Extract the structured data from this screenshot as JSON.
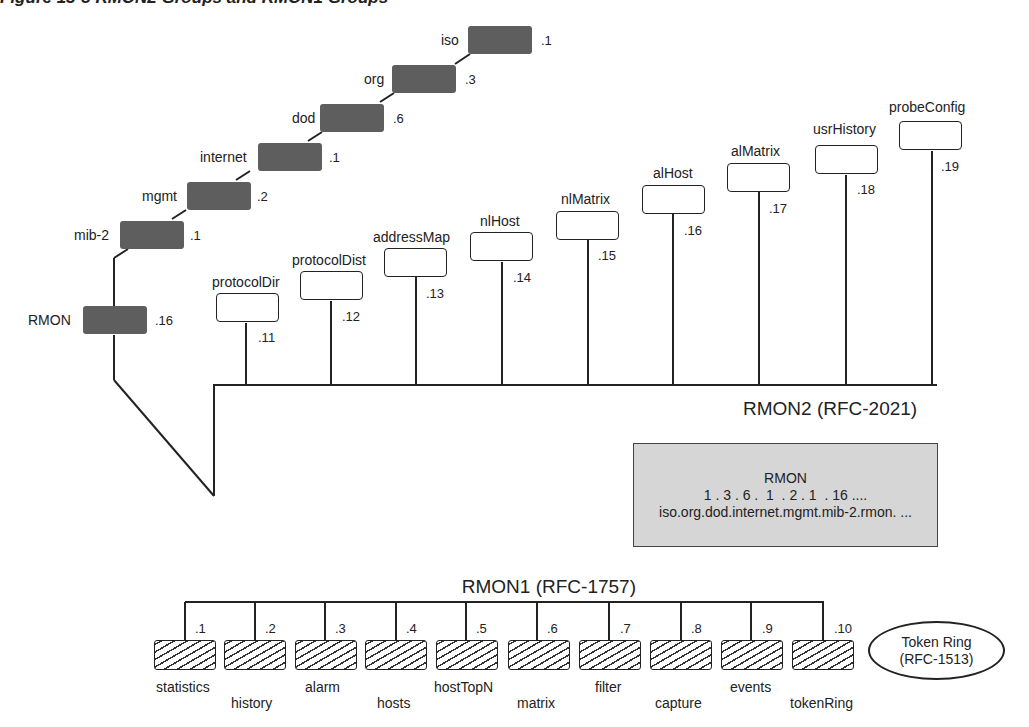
{
  "figure": {
    "title_clipped": "Figure 15-3    RMON2 Groups and RMON1 Groups"
  },
  "oid_path": [
    {
      "name": "iso",
      "oid": ".1"
    },
    {
      "name": "org",
      "oid": ".3"
    },
    {
      "name": "dod",
      "oid": ".6"
    },
    {
      "name": "internet",
      "oid": ".1"
    },
    {
      "name": "mgmt",
      "oid": ".2"
    },
    {
      "name": "mib-2",
      "oid": ".1"
    },
    {
      "name": "RMON",
      "oid": ".16"
    }
  ],
  "rmon2": {
    "label": "RMON2 (RFC-2021)",
    "groups": [
      {
        "name": "protocolDir",
        "oid": ".11"
      },
      {
        "name": "protocolDist",
        "oid": ".12"
      },
      {
        "name": "addressMap",
        "oid": ".13"
      },
      {
        "name": "nlHost",
        "oid": ".14"
      },
      {
        "name": "nlMatrix",
        "oid": ".15"
      },
      {
        "name": "alHost",
        "oid": ".16"
      },
      {
        "name": "alMatrix",
        "oid": ".17"
      },
      {
        "name": "usrHistory",
        "oid": ".18"
      },
      {
        "name": "probeConfig",
        "oid": ".19"
      }
    ]
  },
  "oid_box": {
    "title": "RMON",
    "numeric": "1 . 3 . 6 .  1  . 2 . 1  . 16 ....",
    "named": "iso.org.dod.internet.mgmt.mib-2.rmon. ..."
  },
  "rmon1": {
    "label": "RMON1 (RFC-1757)",
    "groups": [
      {
        "name": "statistics",
        "oid": ".1"
      },
      {
        "name": "history",
        "oid": ".2"
      },
      {
        "name": "alarm",
        "oid": ".3"
      },
      {
        "name": "hosts",
        "oid": ".4"
      },
      {
        "name": "hostTopN",
        "oid": ".5"
      },
      {
        "name": "matrix",
        "oid": ".6"
      },
      {
        "name": "filter",
        "oid": ".7"
      },
      {
        "name": "capture",
        "oid": ".8"
      },
      {
        "name": "events",
        "oid": ".9"
      },
      {
        "name": "tokenRing",
        "oid": ".10"
      }
    ]
  },
  "token_ring": {
    "line1": "Token Ring",
    "line2": "(RFC-1513)"
  },
  "colors": {
    "dark_node": "#5e5e5e",
    "oid_box_fill": "#d6d6d6",
    "line": "#222222"
  }
}
